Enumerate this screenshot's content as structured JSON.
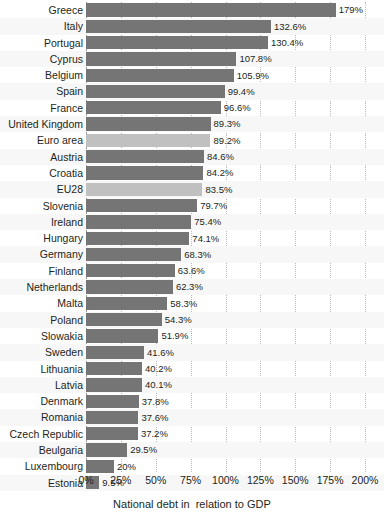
{
  "chart_data": {
    "type": "bar",
    "orientation": "horizontal",
    "title": "",
    "xlabel": "National debt in  relation to GDP",
    "ylabel": "",
    "xlim": [
      0,
      200
    ],
    "xticks": [
      0,
      25,
      50,
      75,
      100,
      125,
      150,
      175,
      200
    ],
    "xtick_labels": [
      "0%",
      "25%",
      "50%",
      "75%",
      "100%",
      "125%",
      "150%",
      "175%",
      "200%"
    ],
    "grid": true,
    "legend": false,
    "categories": [
      "Greece",
      "Italy",
      "Portugal",
      "Cyprus",
      "Belgium",
      "Spain",
      "France",
      "United Kingdom",
      "Euro area",
      "Austria",
      "Croatia",
      "EU28",
      "Slovenia",
      "Ireland",
      "Hungary",
      "Germany",
      "Finland",
      "Netherlands",
      "Malta",
      "Poland",
      "Slowakia",
      "Sweden",
      "Lithuania",
      "Latvia",
      "Denmark",
      "Romania",
      "Czech Republic",
      "Beulgaria",
      "Luxembourg",
      "Estonia"
    ],
    "values": [
      179,
      132.6,
      130.4,
      107.8,
      105.9,
      99.4,
      96.6,
      89.3,
      89.2,
      84.6,
      84.2,
      83.5,
      79.7,
      75.4,
      74.1,
      68.3,
      63.6,
      62.3,
      58.3,
      54.3,
      51.9,
      41.6,
      40.2,
      40.1,
      37.8,
      37.6,
      37.2,
      29.5,
      20,
      9.5
    ],
    "value_labels": [
      "179%",
      "132.6%",
      "130.4%",
      "107.8%",
      "105.9%",
      "99.4%",
      "96.6%",
      "89.3%",
      "89.2%",
      "84.6%",
      "84.2%",
      "83.5%",
      "79.7%",
      "75.4%",
      "74.1%",
      "68.3%",
      "63.6%",
      "62.3%",
      "58.3%",
      "54.3%",
      "51.9%",
      "41.6%",
      "40.2%",
      "40.1%",
      "37.8%",
      "37.6%",
      "37.2%",
      "29.5%",
      "20%",
      "9.5%"
    ],
    "highlight_categories": [
      "Euro area",
      "EU28"
    ],
    "colors": {
      "bar": "#757575",
      "bar_highlight": "#c0c0c0",
      "text": "#231f20",
      "gridline": "#b8b8b8",
      "band": "#f7f7f7",
      "background": "#ffffff"
    }
  }
}
